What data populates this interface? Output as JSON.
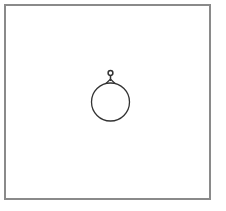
{
  "diagram": {
    "type": "shape-with-handle",
    "shape": "circle",
    "handle": "knob",
    "colors": {
      "stroke": "#333333",
      "frame": "#8a8a8a",
      "background": "#ffffff"
    }
  }
}
